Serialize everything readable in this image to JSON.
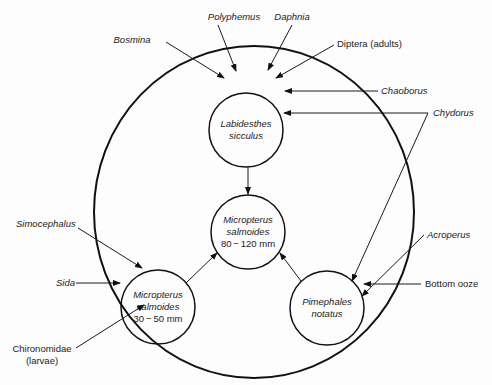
{
  "diagram": {
    "type": "food-web",
    "boundary": "pond-community-circle",
    "nodes": {
      "labidesthes": {
        "line1": "Labidesthes",
        "line2": "sicculus"
      },
      "micropterus_large": {
        "line1": "Micropterus",
        "line2": "salmoides",
        "line3": "80 − 120 mm"
      },
      "micropterus_small": {
        "line1": "Micropterus",
        "line2": "salmoides",
        "line3": "30 − 50 mm"
      },
      "pimephales": {
        "line1": "Pimephales",
        "line2": "notatus"
      }
    },
    "food_sources": {
      "bosmina": "Bosmina",
      "polyphemus": "Polyphemus",
      "daphnia": "Daphnia",
      "diptera": "Diptera (adults)",
      "chaoborus": "Chaoborus",
      "chydorus": "Chydorus",
      "simocephalus": "Simocephalus",
      "sida": "Sida",
      "chironomidae_1": "Chironomidae",
      "chironomidae_2": "(larvae)",
      "acroperus": "Acroperus",
      "bottom_ooze": "Bottom ooze"
    },
    "edges": [
      {
        "from": "Bosmina",
        "to": "Labidesthes sicculus"
      },
      {
        "from": "Polyphemus",
        "to": "Labidesthes sicculus"
      },
      {
        "from": "Daphnia",
        "to": "Labidesthes sicculus"
      },
      {
        "from": "Diptera (adults)",
        "to": "Labidesthes sicculus"
      },
      {
        "from": "Chaoborus",
        "to": "Labidesthes sicculus"
      },
      {
        "from": "Chydorus",
        "to": "Labidesthes sicculus"
      },
      {
        "from": "Chydorus",
        "to": "Pimephales notatus"
      },
      {
        "from": "Labidesthes sicculus",
        "to": "Micropterus salmoides 80-120 mm"
      },
      {
        "from": "Micropterus salmoides 30-50 mm",
        "to": "Micropterus salmoides 80-120 mm"
      },
      {
        "from": "Pimephales notatus",
        "to": "Micropterus salmoides 80-120 mm"
      },
      {
        "from": "Simocephalus",
        "to": "Micropterus salmoides 30-50 mm"
      },
      {
        "from": "Sida",
        "to": "Micropterus salmoides 30-50 mm"
      },
      {
        "from": "Chironomidae (larvae)",
        "to": "Micropterus salmoides 30-50 mm"
      },
      {
        "from": "Acroperus",
        "to": "Pimephales notatus"
      },
      {
        "from": "Bottom ooze",
        "to": "Pimephales notatus"
      }
    ]
  }
}
